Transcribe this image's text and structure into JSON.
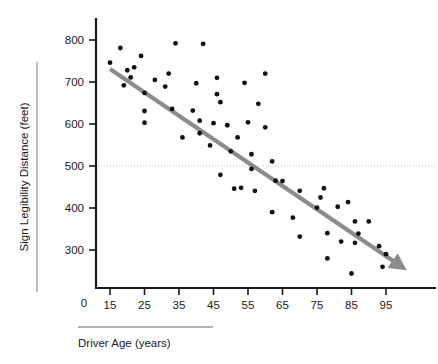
{
  "chart_data": {
    "type": "scatter",
    "title": "",
    "xlabel": "Driver Age (years)",
    "ylabel": "Sign Legibility Distance (feet)",
    "xlim": [
      10,
      103
    ],
    "ylim": [
      220,
      830
    ],
    "x_ticks": [
      15,
      25,
      35,
      45,
      55,
      65,
      75,
      85,
      95
    ],
    "y_ticks": [
      300,
      400,
      500,
      600,
      700,
      800
    ],
    "x_origin_label": "0",
    "y_origin_label": "0",
    "grid": "horizontal dotted reference line at y = 500",
    "reference_line_y": 500,
    "legend": "none",
    "point_color": "#111111",
    "trend_color": "#8c8c8c",
    "trendline": {
      "type": "linear-fit-with-arrow",
      "x_start": 15,
      "y_start": 731,
      "x_end": 101,
      "y_end": 252,
      "slope": -5.57,
      "intercept": 814
    },
    "points": [
      {
        "x": 15,
        "y": 746
      },
      {
        "x": 18,
        "y": 781
      },
      {
        "x": 19,
        "y": 692
      },
      {
        "x": 20,
        "y": 728
      },
      {
        "x": 21,
        "y": 711
      },
      {
        "x": 22,
        "y": 735
      },
      {
        "x": 24,
        "y": 762
      },
      {
        "x": 25,
        "y": 674
      },
      {
        "x": 25,
        "y": 631
      },
      {
        "x": 25,
        "y": 603
      },
      {
        "x": 28,
        "y": 705
      },
      {
        "x": 31,
        "y": 689
      },
      {
        "x": 32,
        "y": 720
      },
      {
        "x": 33,
        "y": 636
      },
      {
        "x": 34,
        "y": 792
      },
      {
        "x": 36,
        "y": 568
      },
      {
        "x": 39,
        "y": 632
      },
      {
        "x": 40,
        "y": 697
      },
      {
        "x": 41,
        "y": 608
      },
      {
        "x": 41,
        "y": 578
      },
      {
        "x": 42,
        "y": 791
      },
      {
        "x": 44,
        "y": 549
      },
      {
        "x": 45,
        "y": 602
      },
      {
        "x": 46,
        "y": 671
      },
      {
        "x": 46,
        "y": 710
      },
      {
        "x": 47,
        "y": 652
      },
      {
        "x": 47,
        "y": 479
      },
      {
        "x": 49,
        "y": 597
      },
      {
        "x": 50,
        "y": 535
      },
      {
        "x": 51,
        "y": 446
      },
      {
        "x": 52,
        "y": 568
      },
      {
        "x": 53,
        "y": 448
      },
      {
        "x": 54,
        "y": 698
      },
      {
        "x": 55,
        "y": 604
      },
      {
        "x": 56,
        "y": 493
      },
      {
        "x": 56,
        "y": 528
      },
      {
        "x": 57,
        "y": 441
      },
      {
        "x": 58,
        "y": 648
      },
      {
        "x": 60,
        "y": 592
      },
      {
        "x": 60,
        "y": 720
      },
      {
        "x": 62,
        "y": 511
      },
      {
        "x": 62,
        "y": 390
      },
      {
        "x": 63,
        "y": 465
      },
      {
        "x": 65,
        "y": 464
      },
      {
        "x": 68,
        "y": 377
      },
      {
        "x": 70,
        "y": 441
      },
      {
        "x": 70,
        "y": 332
      },
      {
        "x": 75,
        "y": 401
      },
      {
        "x": 76,
        "y": 425
      },
      {
        "x": 77,
        "y": 447
      },
      {
        "x": 78,
        "y": 340
      },
      {
        "x": 78,
        "y": 280
      },
      {
        "x": 81,
        "y": 403
      },
      {
        "x": 82,
        "y": 320
      },
      {
        "x": 84,
        "y": 414
      },
      {
        "x": 85,
        "y": 244
      },
      {
        "x": 86,
        "y": 368
      },
      {
        "x": 86,
        "y": 317
      },
      {
        "x": 87,
        "y": 339
      },
      {
        "x": 90,
        "y": 368
      },
      {
        "x": 93,
        "y": 309
      },
      {
        "x": 94,
        "y": 260
      },
      {
        "x": 95,
        "y": 290
      }
    ]
  }
}
